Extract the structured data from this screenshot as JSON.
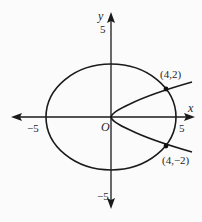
{
  "diagram": {
    "axes": {
      "x_label": "x",
      "y_label": "y",
      "origin_label": "O",
      "ticks": {
        "x_neg": "−5",
        "x_pos": "5",
        "y_pos": "5",
        "y_neg": "−5"
      }
    },
    "curves": [
      {
        "name": "ellipse",
        "equation": "x²/25 + y²/16 = 1",
        "semi_axes": [
          5,
          4
        ]
      },
      {
        "name": "parabola",
        "equation": "y² = x",
        "vertex": [
          0,
          0
        ],
        "opens": "right"
      }
    ],
    "points": [
      {
        "label": "(4,2)",
        "x": 4,
        "y": 2
      },
      {
        "label": "(4,−2)",
        "x": 4,
        "y": -2
      }
    ],
    "colors": {
      "stroke": "#1a1a1a",
      "background": "#fbfbfb"
    }
  }
}
